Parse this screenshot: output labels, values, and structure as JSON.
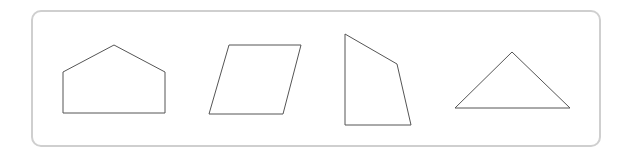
{
  "diagram": {
    "type": "shapes-panel",
    "border_color": "#cfcfcf",
    "stroke_color": "#555555",
    "shapes": [
      {
        "name": "pentagon",
        "points": "63,113 63,72 114,45 165,72 165,113"
      },
      {
        "name": "parallelogram",
        "points": "229,45 301,45 283,114 209,114"
      },
      {
        "name": "quadrilateral",
        "points": "345,34 397,64 411,125 345,125"
      },
      {
        "name": "triangle",
        "points": "455,108 512,52 570,108"
      }
    ]
  }
}
